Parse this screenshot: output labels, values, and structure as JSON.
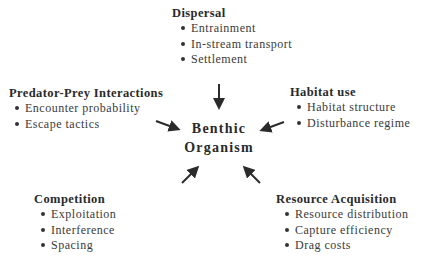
{
  "center": {
    "line1": "Benthic",
    "line2": "Organism"
  },
  "groups": {
    "dispersal": {
      "title": "Dispersal",
      "items": [
        "Entrainment",
        "In-stream transport",
        "Settlement"
      ]
    },
    "predator_prey": {
      "title": "Predator-Prey Interactions",
      "items": [
        "Encounter probability",
        "Escape tactics"
      ]
    },
    "habitat": {
      "title": "Habitat use",
      "items": [
        "Habitat structure",
        "Disturbance regime"
      ]
    },
    "competition": {
      "title": "Competition",
      "items": [
        "Exploitation",
        "Interference",
        "Spacing"
      ]
    },
    "resource": {
      "title": "Resource Acquisition",
      "items": [
        "Resource distribution",
        "Capture efficiency",
        "Drag costs"
      ]
    }
  },
  "colors": {
    "arrow": "#2b2b2b",
    "text": "#333333"
  }
}
